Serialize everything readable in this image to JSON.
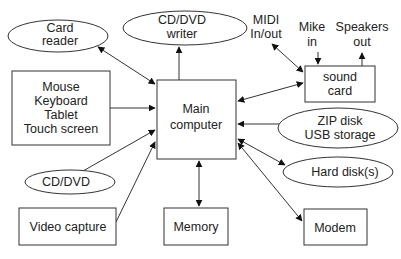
{
  "diagram": {
    "center": {
      "lines": [
        "Main",
        "computer"
      ]
    },
    "nodes": {
      "card_reader": {
        "lines": [
          "Card",
          "reader"
        ],
        "shape": "ellipse"
      },
      "cd_dvd_writer": {
        "lines": [
          "CD/DVD",
          "writer"
        ],
        "shape": "ellipse"
      },
      "input_devices": {
        "lines": [
          "Mouse",
          "Keyboard",
          "Tablet",
          "Touch screen"
        ],
        "shape": "rect"
      },
      "cd_dvd": {
        "lines": [
          "CD/DVD"
        ],
        "shape": "ellipse"
      },
      "video_capture": {
        "lines": [
          "Video capture"
        ],
        "shape": "rect"
      },
      "memory": {
        "lines": [
          "Memory"
        ],
        "shape": "rect"
      },
      "sound_card": {
        "lines": [
          "sound",
          "card"
        ],
        "shape": "rect"
      },
      "zip_usb": {
        "lines": [
          "ZIP disk",
          "USB storage"
        ],
        "shape": "ellipse"
      },
      "hard_disks": {
        "lines": [
          "Hard disk(s)"
        ],
        "shape": "ellipse"
      },
      "modem": {
        "lines": [
          "Modem"
        ],
        "shape": "rect"
      }
    },
    "labels": {
      "midi": [
        "MIDI",
        "In/out"
      ],
      "mike": [
        "Mike",
        "in"
      ],
      "speakers": [
        "Speakers",
        "out"
      ]
    },
    "edges": [
      {
        "from": "card_reader",
        "to": "center",
        "direction": "both"
      },
      {
        "from": "center",
        "to": "cd_dvd_writer",
        "direction": "forward"
      },
      {
        "from": "input_devices",
        "to": "center",
        "direction": "forward"
      },
      {
        "from": "cd_dvd",
        "to": "center",
        "direction": "forward"
      },
      {
        "from": "video_capture",
        "to": "center",
        "direction": "forward"
      },
      {
        "from": "center",
        "to": "memory",
        "direction": "both"
      },
      {
        "from": "center",
        "to": "sound_card",
        "direction": "both"
      },
      {
        "from": "center",
        "to": "zip_usb",
        "direction": "both"
      },
      {
        "from": "center",
        "to": "hard_disks",
        "direction": "both"
      },
      {
        "from": "center",
        "to": "modem",
        "direction": "both"
      },
      {
        "from": "midi",
        "to": "sound_card",
        "direction": "both"
      },
      {
        "from": "mike",
        "to": "sound_card",
        "direction": "forward"
      },
      {
        "from": "sound_card",
        "to": "speakers",
        "direction": "forward"
      }
    ]
  }
}
